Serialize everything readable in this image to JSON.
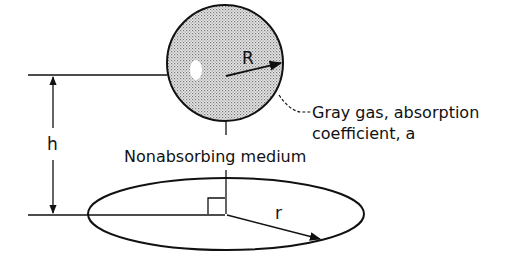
{
  "diagram": {
    "labels": {
      "sphere_radius": "R",
      "height": "h",
      "disk_radius": "r",
      "gas_line1": "Gray gas, absorption",
      "gas_line2": "coefficient, a",
      "medium": "Nonabsorbing medium"
    },
    "colors": {
      "stroke": "#111111",
      "sphere_fill": "#cfcfcf"
    }
  }
}
